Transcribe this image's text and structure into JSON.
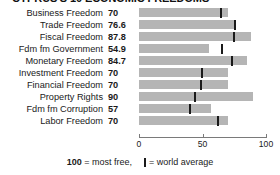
{
  "title": "CYPRUS'S 10 ECONOMIC FREEDOMS",
  "axis": {
    "ticks": [
      {
        "label": "0",
        "value": 0
      },
      {
        "label": "50",
        "value": 50
      },
      {
        "label": "100",
        "value": 100
      }
    ],
    "min": 0,
    "max": 100
  },
  "caption": {
    "most_free_value": "100",
    "most_free_text": " = most free,",
    "world_average_text": "= world average",
    "tick_icon": "world-average-tick-icon"
  },
  "colors": {
    "bar": "#b5b5b5",
    "tick": "#1a1a1a",
    "axis": "#7a7a7a",
    "text": "#1a1a1a"
  },
  "chart_data": {
    "type": "bar",
    "title": "CYPRUS'S 10 ECONOMIC FREEDOMS",
    "xlabel": "",
    "ylabel": "",
    "xlim": [
      0,
      100
    ],
    "grid": false,
    "orientation": "horizontal",
    "legend": [
      "100 = most free",
      "world average"
    ],
    "categories": [
      "Business Freedom",
      "Trade Freedom",
      "Fiscal Freedom",
      "Fdm fm Government",
      "Monetary Freedom",
      "Investment Freedom",
      "Financial Freedom",
      "Property Rights",
      "Fdm fm Corruption",
      "Labor Freedom"
    ],
    "series": [
      {
        "name": "Cyprus",
        "values": [
          70,
          76.6,
          87.8,
          54.9,
          84.7,
          70,
          70,
          90,
          57,
          70
        ]
      },
      {
        "name": "world average",
        "values": [
          64.7,
          75.2,
          74.9,
          65.5,
          73.4,
          49.3,
          49.1,
          44.2,
          40.5,
          62.1
        ]
      }
    ],
    "value_labels": [
      "70",
      "76.6",
      "87.8",
      "54.9",
      "84.7",
      "70",
      "70",
      "90",
      "57",
      "70"
    ]
  }
}
